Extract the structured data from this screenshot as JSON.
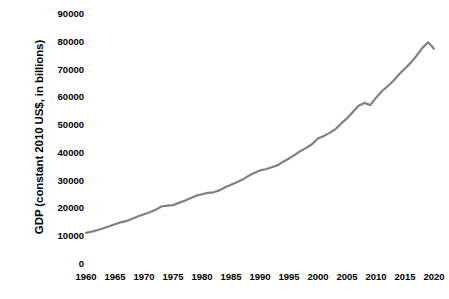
{
  "chart_data": {
    "type": "line",
    "title": "",
    "subtitle": "",
    "xlabel": "",
    "ylabel": "GDP (constant 2010 US$, in billions)",
    "grid": false,
    "legend": false,
    "legend_position": "none",
    "line_color": "#808080",
    "line_width": 2.2,
    "background_color": "#ffffff",
    "text_color": "#000000",
    "axis_spines": false,
    "tick_marks": false,
    "markers": false,
    "xlim": [
      1960,
      2020
    ],
    "ylim": [
      0,
      90000
    ],
    "x_tick_labels": [
      "1960",
      "1965",
      "1970",
      "1975",
      "1980",
      "1985",
      "1990",
      "1995",
      "2000",
      "2005",
      "2010",
      "2015",
      "2020"
    ],
    "x_ticks": [
      1960,
      1965,
      1970,
      1975,
      1980,
      1985,
      1990,
      1995,
      2000,
      2005,
      2010,
      2015,
      2020
    ],
    "y_tick_labels": [
      "0",
      "10000",
      "20000",
      "30000",
      "40000",
      "50000",
      "60000",
      "70000",
      "80000",
      "90000"
    ],
    "y_ticks": [
      0,
      10000,
      20000,
      30000,
      40000,
      50000,
      60000,
      70000,
      80000,
      90000
    ],
    "series": [
      {
        "name": "World GDP",
        "x": [
          1960,
          1961,
          1962,
          1963,
          1964,
          1965,
          1966,
          1967,
          1968,
          1969,
          1970,
          1971,
          1972,
          1973,
          1974,
          1975,
          1976,
          1977,
          1978,
          1979,
          1980,
          1981,
          1982,
          1983,
          1984,
          1985,
          1986,
          1987,
          1988,
          1989,
          1990,
          1991,
          1992,
          1993,
          1994,
          1995,
          1996,
          1997,
          1998,
          1999,
          2000,
          2001,
          2002,
          2003,
          2004,
          2005,
          2006,
          2007,
          2008,
          2009,
          2010,
          2011,
          2012,
          2013,
          2014,
          2015,
          2016,
          2017,
          2018,
          2019,
          2020
        ],
        "values": [
          11200,
          11650,
          12250,
          12850,
          13600,
          14300,
          15000,
          15500,
          16300,
          17200,
          17900,
          18600,
          19500,
          20700,
          21000,
          21200,
          22000,
          22800,
          23700,
          24600,
          25100,
          25600,
          25800,
          26500,
          27600,
          28500,
          29400,
          30400,
          31700,
          32800,
          33700,
          34100,
          34800,
          35500,
          36800,
          38000,
          39300,
          40700,
          41800,
          43200,
          45200,
          46100,
          47200,
          48500,
          50600,
          52400,
          54700,
          57000,
          58000,
          57200,
          59800,
          62200,
          64000,
          66000,
          68300,
          70400,
          72500,
          75000,
          77800,
          79800,
          77500
        ]
      }
    ],
    "annotations": [
      {
        "label": "2008-2009 global financial crisis dip",
        "x": 2009,
        "y": 57200
      },
      {
        "label": "2020 COVID-19 recession drop",
        "x": 2020,
        "y": 77500
      }
    ]
  }
}
